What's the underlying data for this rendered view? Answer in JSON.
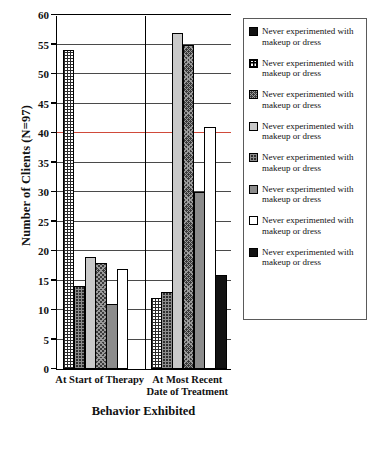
{
  "chart_data": {
    "type": "bar",
    "title": "",
    "xlabel": "Behavior Exhibited",
    "ylabel": "Number of Clients (N=97)",
    "ylim": [
      0,
      60
    ],
    "ytick_step": 5,
    "yticks": [
      0,
      5,
      10,
      15,
      20,
      25,
      30,
      35,
      40,
      45,
      50,
      55,
      60
    ],
    "grid": true,
    "legend_position": "right",
    "categories": [
      "At Start of Therapy",
      "At Most Recent Date of Treatment"
    ],
    "category_lines": [
      [
        "At Start of Therapy"
      ],
      [
        "At Most Recent",
        "Date of Treatment"
      ]
    ],
    "series": [
      {
        "name": "Never experimented with makeup or dress",
        "pattern": "fine-grid",
        "values": [
          54,
          12
        ]
      },
      {
        "name": "Never experimented with makeup or dress",
        "pattern": "dark-checkered",
        "values": [
          14,
          13
        ]
      },
      {
        "name": "Never experimented with makeup or dress",
        "pattern": "light-gray",
        "values": [
          19,
          57
        ]
      },
      {
        "name": "Never experimented with makeup or dress",
        "pattern": "dark-cross-check",
        "values": [
          18,
          55
        ]
      },
      {
        "name": "Never experimented with makeup or dress",
        "pattern": "medium-gray",
        "values": [
          11,
          30
        ]
      },
      {
        "name": "Never experimented with makeup or dress",
        "pattern": "white",
        "values": [
          17,
          41
        ]
      },
      {
        "name": "Never experimented with makeup or dress",
        "pattern": "solid-black",
        "values": [
          0,
          16
        ]
      }
    ]
  },
  "legend": {
    "entries": [
      {
        "label": "Never experimented with makeup or dress",
        "pattern": "solid-black"
      },
      {
        "label": "Never experimented with makeup or dress",
        "pattern": "framed-cross"
      },
      {
        "label": "Never experimented with makeup or dress",
        "pattern": "dark-cross-check"
      },
      {
        "label": "Never experimented with makeup or dress",
        "pattern": "light-gray"
      },
      {
        "label": "Never experimented with makeup or dress",
        "pattern": "dark-checkered"
      },
      {
        "label": "Never experimented with makeup or dress",
        "pattern": "medium-gray"
      },
      {
        "label": "Never experimented with makeup or dress",
        "pattern": "white"
      },
      {
        "label": "Never experimented with makeup or dress",
        "pattern": "solid-black"
      }
    ]
  },
  "colors": {
    "axis": "#000000",
    "gridline": "#4a4a4a",
    "highlight_gridline_40": "#d04a3a",
    "legend_border": "#5a5a5a",
    "light_gray": "#c9c9c9",
    "medium_gray": "#8c8c8c",
    "black": "#121212",
    "white": "#ffffff"
  }
}
